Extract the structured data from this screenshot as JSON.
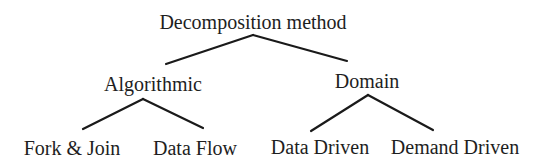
{
  "diagram": {
    "title": "Decomposition method",
    "type": "tree",
    "colors": {
      "background": "#ffffff",
      "text": "#1e1e1e",
      "line": "#1a1a1a"
    },
    "root": {
      "label": "Decomposition method"
    },
    "level1": [
      {
        "label": "Algorithmic"
      },
      {
        "label": "Domain"
      }
    ],
    "level2": [
      {
        "label": "Fork & Join",
        "parent": "Algorithmic"
      },
      {
        "label": "Data Flow",
        "parent": "Algorithmic"
      },
      {
        "label": "Data Driven",
        "parent": "Domain"
      },
      {
        "label": "Demand Driven",
        "parent": "Domain"
      }
    ]
  }
}
